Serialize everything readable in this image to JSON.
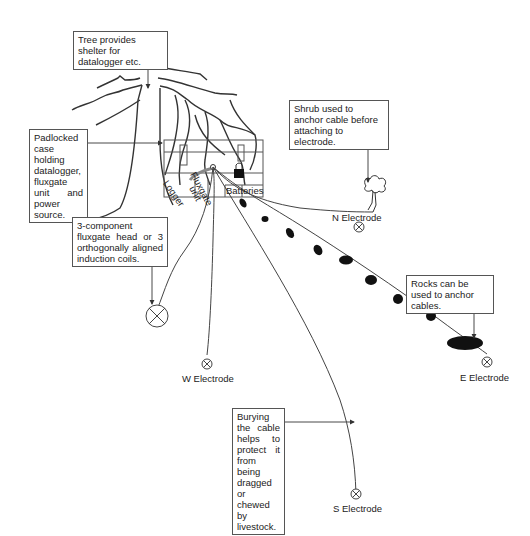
{
  "diagram": {
    "callouts": {
      "tree": "Tree provides shelter for datalogger etc.",
      "case": "Padlocked case holding datalogger, fluxgate unit and power source.",
      "shrub": "Shrub used to anchor cable before attaching to electrode.",
      "fluxgate": "3-component fluxgate head or 3 orthogonally aligned induction coils.",
      "rocks": "Rocks can be used to anchor cables.",
      "bury": "Burying the cable helps to protect it from being dragged or chewed by livestock."
    },
    "case_compartments": {
      "logger": "Logger",
      "fluxgate_unit_1": "Fluxgate",
      "fluxgate_unit_2": "unit",
      "batteries": "Batteries"
    },
    "electrodes": {
      "north": "N Electrode",
      "east": "E Electrode",
      "west": "W Electrode",
      "south": "S Electrode"
    },
    "colors": {
      "line": "#333333",
      "rock": "#111111",
      "box_border": "#555555"
    }
  }
}
